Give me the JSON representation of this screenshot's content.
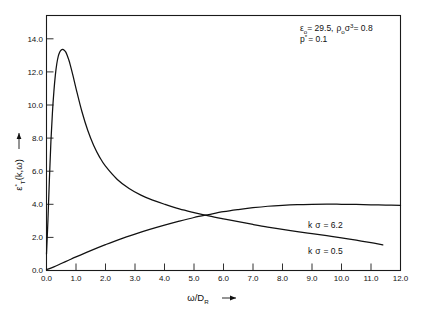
{
  "figure": {
    "background_color": "#ffffff",
    "line_color": "#111111"
  },
  "annotations": {
    "line1": {
      "epsilon_symbol": "ε",
      "epsilon_sub": "o",
      "epsilon_value": "= 29.5,",
      "rho_symbol": "ρ",
      "rho_sub": "o",
      "sigma_symbol": "σ",
      "sigma_sup": "3",
      "rho_value": "= 0.8",
      "full_text": "εo = 29.5, ρoσ³ = 0.8"
    },
    "line2": {
      "p_symbol": "p",
      "p_sup": "*",
      "p_value": "= 0.1",
      "full_text": "p* = 0.1"
    }
  },
  "curve_labels": [
    {
      "name": "k-sigma-6-2",
      "k_symbol": "k",
      "sigma_symbol": "σ",
      "value": "= 6.2",
      "full_text": "k σ = 6.2"
    },
    {
      "name": "k-sigma-0-5",
      "k_symbol": "k",
      "sigma_symbol": "σ",
      "value": "= 0.5",
      "full_text": "k σ = 0.5"
    }
  ],
  "axis_titles": {
    "x": {
      "numerator": "ω",
      "slash": "/D",
      "sub": "R",
      "arrow": "→",
      "full_text": "ω/D_R →"
    },
    "y": {
      "symbol": "ε",
      "sub": "T",
      "sup": "*",
      "args": "(k,ω)",
      "arrow": "→",
      "full_text": "ε*_T(k,ω) →"
    }
  },
  "chart_data": {
    "type": "line",
    "title": "",
    "subtitle": "",
    "xlabel": "ω/D_R",
    "ylabel": "ε*_T(k,ω)",
    "xlim": [
      0.0,
      12.0
    ],
    "ylim": [
      0.0,
      15.4
    ],
    "grid": false,
    "legend": "inline-annotations",
    "xticks": [
      "0.0",
      "1.0",
      "2.0",
      "3.0",
      "4.0",
      "5.0",
      "6.0",
      "7.0",
      "8.0",
      "9.0",
      "10.0",
      "11.0",
      "12.0"
    ],
    "xtick_values": [
      0.0,
      1.0,
      2.0,
      3.0,
      4.0,
      5.0,
      6.0,
      7.0,
      8.0,
      9.0,
      10.0,
      11.0,
      12.0
    ],
    "yticks": [
      "0.0",
      "2.0",
      "4.0",
      "6.0",
      "8.0",
      "10.0",
      "12.0",
      "14.0"
    ],
    "ytick_values": [
      0.0,
      2.0,
      4.0,
      6.0,
      8.0,
      10.0,
      12.0,
      14.0
    ],
    "annotations": [
      {
        "text": "εo = 29.5, ρoσ³ = 0.8",
        "x": 7.8,
        "y": 15.0
      },
      {
        "text": "p* = 0.1",
        "x": 7.8,
        "y": 14.2
      },
      {
        "text": "k σ = 6.2",
        "x": 9.3,
        "y": 3.0
      },
      {
        "text": "k σ = 0.5",
        "x": 9.3,
        "y": 1.45
      }
    ],
    "series": [
      {
        "name": "k σ = 0.5",
        "description": "sharply peaked resonance decaying toward high frequency",
        "x": [
          0.0,
          0.05,
          0.1,
          0.15,
          0.2,
          0.25,
          0.3,
          0.35,
          0.4,
          0.45,
          0.5,
          0.55,
          0.6,
          0.65,
          0.7,
          0.75,
          0.8,
          0.9,
          1.0,
          1.2,
          1.4,
          1.6,
          1.8,
          2.0,
          2.4,
          2.8,
          3.2,
          3.6,
          4.0,
          4.5,
          5.0,
          5.5,
          6.0,
          6.5,
          7.0,
          7.5,
          8.0,
          8.5,
          9.0,
          9.5,
          10.0,
          10.5,
          11.0,
          11.4
        ],
        "y": [
          1.0,
          3.1,
          5.6,
          7.8,
          9.5,
          10.8,
          11.8,
          12.5,
          12.95,
          13.2,
          13.32,
          13.35,
          13.3,
          13.2,
          13.0,
          12.75,
          12.45,
          11.75,
          11.0,
          9.6,
          8.45,
          7.55,
          6.85,
          6.3,
          5.5,
          4.95,
          4.55,
          4.25,
          4.0,
          3.72,
          3.5,
          3.3,
          3.12,
          2.95,
          2.78,
          2.62,
          2.48,
          2.35,
          2.22,
          2.1,
          1.97,
          1.83,
          1.68,
          1.55
        ]
      },
      {
        "name": "k σ = 6.2",
        "description": "monotonically rising curve saturating near 4.0",
        "x": [
          0.0,
          0.25,
          0.5,
          0.75,
          1.0,
          1.5,
          2.0,
          2.5,
          3.0,
          3.5,
          4.0,
          4.5,
          5.0,
          5.5,
          6.0,
          6.5,
          7.0,
          7.5,
          8.0,
          8.5,
          9.0,
          9.5,
          10.0,
          10.5,
          11.0,
          11.5,
          12.0
        ],
        "y": [
          0.05,
          0.22,
          0.42,
          0.62,
          0.82,
          1.2,
          1.56,
          1.9,
          2.2,
          2.48,
          2.74,
          2.98,
          3.2,
          3.38,
          3.55,
          3.68,
          3.79,
          3.88,
          3.94,
          3.98,
          4.0,
          4.01,
          4.0,
          3.99,
          3.97,
          3.95,
          3.93
        ]
      }
    ]
  }
}
